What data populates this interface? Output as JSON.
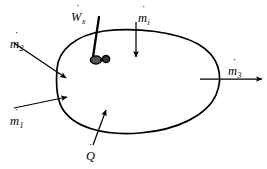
{
  "diagram": {
    "stroke_color": "#000000",
    "background_color": "#ffffff",
    "boundary": {
      "name": "control-volume-boundary",
      "shape": "egg-shaped closed curve"
    },
    "labels": {
      "mass_in_2": {
        "symbol": "m",
        "accent": "˙",
        "subscript": "2"
      },
      "mass_in_1": {
        "symbol": "m",
        "accent": "˙",
        "subscript": "1"
      },
      "mass_in_top": {
        "symbol": "m",
        "accent": "˙",
        "subscript": "i"
      },
      "mass_out_3": {
        "symbol": "m",
        "accent": "˙",
        "subscript": "3"
      },
      "heat_in": {
        "symbol": "Q",
        "accent": "˙",
        "subscript": ""
      },
      "shaft_work": {
        "symbol": "W",
        "accent": "˙",
        "subscript": "x"
      }
    },
    "arrows": [
      {
        "name": "mass-flow-arrow-2",
        "direction": "into-boundary",
        "from": "upper-left"
      },
      {
        "name": "mass-flow-arrow-1",
        "direction": "into-boundary",
        "from": "lower-left"
      },
      {
        "name": "mass-flow-arrow-top",
        "direction": "into-boundary",
        "from": "top"
      },
      {
        "name": "mass-flow-arrow-3",
        "direction": "out-of-boundary",
        "from": "right"
      },
      {
        "name": "heat-transfer-arrow",
        "direction": "into-boundary",
        "from": "bottom"
      }
    ],
    "shaft": {
      "name": "shaft-work-rod",
      "rotor": "two-circle rotor symbol"
    }
  }
}
